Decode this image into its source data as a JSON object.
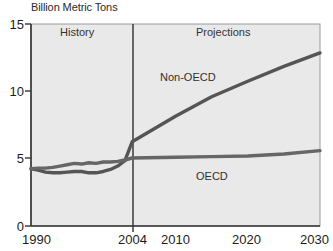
{
  "chart_data": {
    "type": "line",
    "title": "Billion Metric Tons",
    "xlabel": "",
    "ylabel": "",
    "xlim": [
      1990,
      2030
    ],
    "ylim": [
      0,
      15
    ],
    "yticks": [
      "0",
      "5",
      "10",
      "15"
    ],
    "ytick_values": [
      0,
      5,
      10,
      15
    ],
    "xticks": [
      "1990",
      "2004",
      "2010",
      "2020",
      "2030"
    ],
    "xtick_values": [
      1990,
      2004,
      2010,
      2020,
      2030
    ],
    "grid": false,
    "legend_position": "inline-annotation",
    "divider_x": 2004,
    "annotations": [
      {
        "text": "History",
        "x": 1996,
        "y": 14.0
      },
      {
        "text": "Projections",
        "x": 2017,
        "y": 14.0
      },
      {
        "text": "Non-OECD",
        "x": 2011,
        "y": 10.6
      },
      {
        "text": "OECD",
        "x": 2018,
        "y": 3.6
      }
    ],
    "x": [
      1990,
      1991,
      1992,
      1993,
      1994,
      1995,
      1996,
      1997,
      1998,
      1999,
      2000,
      2001,
      2002,
      2003,
      2004,
      2010,
      2015,
      2020,
      2025,
      2030
    ],
    "series": [
      {
        "name": "Non-OECD",
        "values": [
          4.25,
          4.15,
          4.0,
          3.95,
          3.95,
          4.0,
          4.05,
          4.05,
          3.95,
          3.95,
          4.05,
          4.2,
          4.45,
          4.85,
          6.25,
          8.15,
          9.6,
          10.75,
          11.85,
          12.85
        ],
        "color": "#555555"
      },
      {
        "name": "OECD",
        "values": [
          4.25,
          4.3,
          4.3,
          4.35,
          4.45,
          4.55,
          4.65,
          4.6,
          4.7,
          4.65,
          4.75,
          4.75,
          4.8,
          4.9,
          5.05,
          5.1,
          5.15,
          5.2,
          5.35,
          5.6
        ],
        "color": "#666666"
      }
    ],
    "colors": {
      "plot_background": "#e9e9e9",
      "axis": "#3a3a3a",
      "frame": "#888888",
      "text": "#1c1c1c",
      "non_oecd_line": "#555555",
      "oecd_line": "#6a6a6a"
    }
  }
}
